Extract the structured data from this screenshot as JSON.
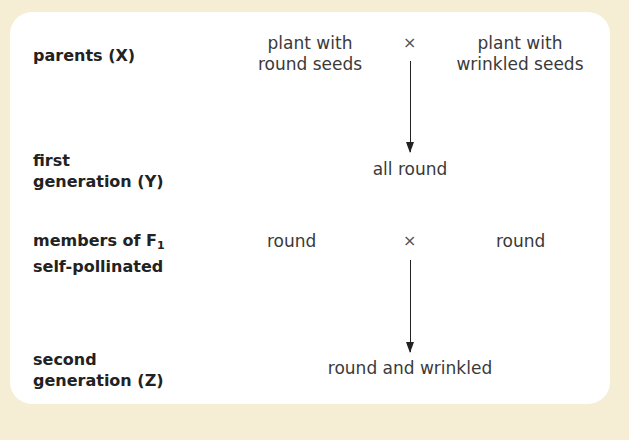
{
  "diagram": {
    "rows": [
      {
        "label": "parents (X)",
        "left": [
          "plant with",
          "round seeds"
        ],
        "operator": "×",
        "right": [
          "plant with",
          "wrinkled seeds"
        ]
      },
      {
        "label_lines": [
          "first",
          "generation (Y)"
        ],
        "result": "all round"
      },
      {
        "label_lines": [
          "members of F",
          "self-pollinated"
        ],
        "label_subscript": "1",
        "left": "round",
        "operator": "×",
        "right": "round"
      },
      {
        "label_lines": [
          "second",
          "generation (Z)"
        ],
        "result": "round and wrinkled"
      }
    ],
    "colors": {
      "background": "#f6eed4",
      "panel": "#ffffff",
      "text": "#3a3a3a",
      "arrow": "#222222"
    }
  }
}
